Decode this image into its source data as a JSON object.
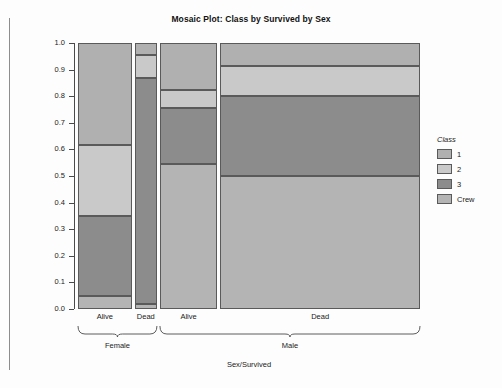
{
  "title": "Mosaic Plot: Class by Survived by Sex",
  "axes": {
    "ylabel": "Proportion",
    "xlabel": "Sex/Survived",
    "yticks": [
      "1.0",
      "0.9",
      "0.8",
      "0.7",
      "0.6",
      "0.5",
      "0.4",
      "0.3",
      "0.2",
      "0.1",
      "0.0"
    ]
  },
  "legend": {
    "title": "Class",
    "items": [
      {
        "label": "1",
        "color": "#b0b0b0"
      },
      {
        "label": "2",
        "color": "#c9c9c9"
      },
      {
        "label": "3",
        "color": "#8c8c8c"
      },
      {
        "label": "Crew",
        "color": "#b4b4b4"
      }
    ]
  },
  "chart_data": {
    "type": "bar",
    "subtype": "mosaic",
    "title": "Mosaic Plot: Class by Survived by Sex",
    "xlabel": "Sex/Survived",
    "ylabel": "Proportion",
    "ylim": [
      0.0,
      1.0
    ],
    "grid": false,
    "legend_position": "right",
    "legend_title": "Class",
    "stack_order_bottom_to_top": [
      "Crew",
      "3",
      "2",
      "1"
    ],
    "groups": [
      {
        "name": "Female",
        "columns": [
          "Alive",
          "Dead"
        ]
      },
      {
        "name": "Male",
        "columns": [
          "Alive",
          "Dead"
        ]
      }
    ],
    "categories": [
      "Female/Alive",
      "Female/Dead",
      "Male/Alive",
      "Male/Dead"
    ],
    "column_widths_fraction": [
      0.161,
      0.067,
      0.172,
      0.6
    ],
    "series": [
      {
        "name": "1",
        "color": "#b0b0b0",
        "values": [
          0.385,
          0.045,
          0.175,
          0.085
        ]
      },
      {
        "name": "2",
        "color": "#c9c9c9",
        "values": [
          0.265,
          0.085,
          0.07,
          0.115
        ]
      },
      {
        "name": "3",
        "color": "#8c8c8c",
        "values": [
          0.3,
          0.85,
          0.21,
          0.3
        ]
      },
      {
        "name": "Crew",
        "color": "#b4b4b4",
        "values": [
          0.05,
          0.02,
          0.545,
          0.5
        ]
      }
    ],
    "segment_boundaries": {
      "Female/Alive": {
        "Crew": [
          0.0,
          0.05
        ],
        "3": [
          0.05,
          0.35
        ],
        "2": [
          0.35,
          0.615
        ],
        "1": [
          0.615,
          1.0
        ]
      },
      "Female/Dead": {
        "Crew": [
          0.0,
          0.02
        ],
        "3": [
          0.02,
          0.87
        ],
        "2": [
          0.87,
          0.955
        ],
        "1": [
          0.955,
          1.0
        ]
      },
      "Male/Alive": {
        "Crew": [
          0.0,
          0.545
        ],
        "3": [
          0.545,
          0.755
        ],
        "2": [
          0.755,
          0.825
        ],
        "1": [
          0.825,
          1.0
        ]
      },
      "Male/Dead": {
        "Crew": [
          0.0,
          0.5
        ],
        "3": [
          0.5,
          0.8
        ],
        "2": [
          0.8,
          0.915
        ],
        "1": [
          0.915,
          1.0
        ]
      }
    }
  }
}
